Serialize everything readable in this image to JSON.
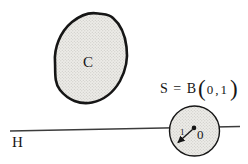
{
  "figure": {
    "labels": {
      "convex_set": "C",
      "hyperplane": "H",
      "ball_prefix": "S = B",
      "paren_open": "(",
      "ball_args": "0,1",
      "paren_close": ")",
      "center": "0",
      "radius": "1"
    },
    "colors": {
      "outline": "#161616",
      "hyperplane_line": "#3c3c3c",
      "fill_base": "#edece8",
      "fill_stipple_dot": "#c3c2bd",
      "background": "#ffffff"
    }
  }
}
